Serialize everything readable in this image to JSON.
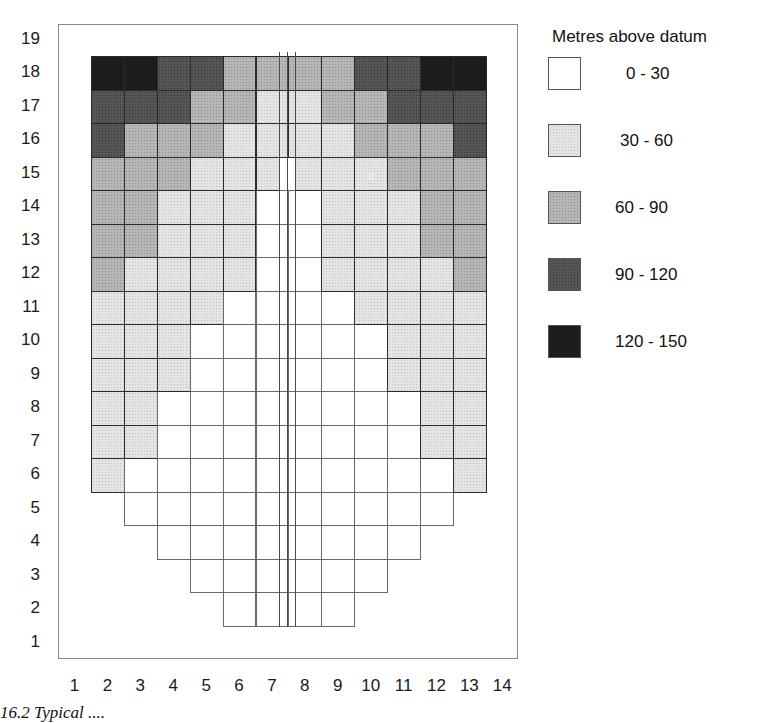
{
  "chart_data": {
    "type": "heatmap",
    "title": "",
    "legend_title": "Metres above datum",
    "legend": [
      {
        "range": "0 - 30",
        "class": 0,
        "color": "#ffffff"
      },
      {
        "range": "30 - 60",
        "class": 1,
        "color": "#e4e4e4"
      },
      {
        "range": "60 - 90",
        "class": 2,
        "color": "#b6b6b6"
      },
      {
        "range": "90  - 120",
        "class": 3,
        "color": "#555555"
      },
      {
        "range": "120 - 150",
        "class": 4,
        "color": "#1c1c1c"
      }
    ],
    "x_ticks": [
      "1",
      "2",
      "3",
      "4",
      "5",
      "6",
      "7",
      "8",
      "9",
      "10",
      "11",
      "12",
      "13",
      "14"
    ],
    "y_ticks": [
      "19",
      "18",
      "17",
      "16",
      "15",
      "14",
      "13",
      "12",
      "11",
      "10",
      "9",
      "8",
      "7",
      "6",
      "5",
      "4",
      "3",
      "2",
      "1"
    ],
    "xlabel": "",
    "ylabel": "",
    "grid_columns": [
      2,
      3,
      4,
      5,
      6,
      7,
      8,
      9,
      10,
      11,
      12,
      13
    ],
    "note": "rows list class index per column 2..13; null = no cell",
    "rows": {
      "18": [
        4,
        4,
        3,
        3,
        2,
        2,
        2,
        2,
        3,
        3,
        4,
        4
      ],
      "17": [
        3,
        3,
        3,
        2,
        2,
        1,
        1,
        2,
        2,
        3,
        3,
        3
      ],
      "16": [
        3,
        2,
        2,
        2,
        1,
        1,
        1,
        1,
        2,
        2,
        2,
        3
      ],
      "15": [
        2,
        2,
        2,
        1,
        1,
        1,
        1,
        1,
        1,
        2,
        2,
        2
      ],
      "14": [
        2,
        2,
        1,
        1,
        1,
        0,
        0,
        1,
        1,
        1,
        2,
        2
      ],
      "13": [
        2,
        2,
        1,
        1,
        1,
        0,
        0,
        1,
        1,
        1,
        2,
        2
      ],
      "12": [
        2,
        1,
        1,
        1,
        1,
        0,
        0,
        1,
        1,
        1,
        1,
        2
      ],
      "11": [
        1,
        1,
        1,
        1,
        0,
        0,
        0,
        0,
        1,
        1,
        1,
        1
      ],
      "10": [
        1,
        1,
        1,
        0,
        0,
        0,
        0,
        0,
        0,
        1,
        1,
        1
      ],
      "9": [
        1,
        1,
        1,
        0,
        0,
        0,
        0,
        0,
        0,
        1,
        1,
        1
      ],
      "8": [
        1,
        1,
        0,
        0,
        0,
        0,
        0,
        0,
        0,
        0,
        1,
        1
      ],
      "7": [
        1,
        1,
        0,
        0,
        0,
        0,
        0,
        0,
        0,
        0,
        1,
        1
      ],
      "6": [
        1,
        0,
        0,
        0,
        0,
        0,
        0,
        0,
        0,
        0,
        0,
        1
      ],
      "5": [
        null,
        0,
        0,
        0,
        0,
        0,
        0,
        0,
        0,
        0,
        0,
        null
      ],
      "4": [
        null,
        null,
        0,
        0,
        0,
        0,
        0,
        0,
        0,
        0,
        null,
        null
      ],
      "3": [
        null,
        null,
        null,
        0,
        0,
        0,
        0,
        0,
        0,
        null,
        null,
        null
      ],
      "2": [
        null,
        null,
        null,
        null,
        0,
        0,
        0,
        0,
        null,
        null,
        null,
        null
      ]
    },
    "center_strip_white_row": "15"
  },
  "annotation_mark": "c",
  "caption": "16.2   Typical ...."
}
